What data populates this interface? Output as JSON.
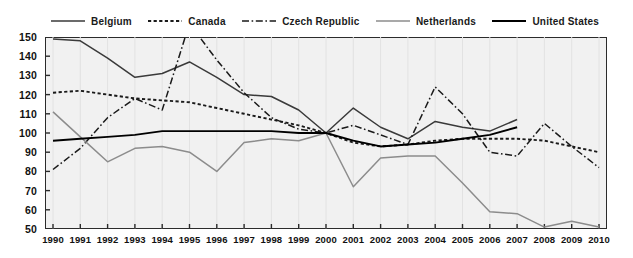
{
  "legend": {
    "position": "top",
    "items": [
      {
        "label": "Belgium",
        "style": "solid",
        "color": "#3a3a3a",
        "width": 1.6
      },
      {
        "label": "Canada",
        "style": "dotted",
        "color": "#1a1a1a",
        "width": 2.0
      },
      {
        "label": "Czech Republic",
        "style": "dashdot",
        "color": "#1a1a1a",
        "width": 1.6
      },
      {
        "label": "Netherlands",
        "style": "solid",
        "color": "#8c8c8c",
        "width": 1.6
      },
      {
        "label": "United States",
        "style": "solid",
        "color": "#000000",
        "width": 2.0
      }
    ]
  },
  "axes": {
    "y_ticks": [
      150,
      140,
      130,
      120,
      110,
      100,
      90,
      80,
      70,
      60,
      50
    ],
    "x_ticks": [
      1990,
      1991,
      1992,
      1993,
      1994,
      1995,
      1996,
      1997,
      1998,
      1999,
      2000,
      2001,
      2002,
      2003,
      2004,
      2005,
      2006,
      2007,
      2008,
      2009,
      2010
    ]
  },
  "chart_data": {
    "type": "line",
    "title": "",
    "subtitle": "",
    "xlabel": "",
    "ylabel": "",
    "xlim": [
      1990,
      2010
    ],
    "ylim": [
      50,
      150
    ],
    "grid": "vertical-faint",
    "legend_position": "top",
    "x": [
      1990,
      1991,
      1992,
      1993,
      1994,
      1995,
      1996,
      1997,
      1998,
      1999,
      2000,
      2001,
      2002,
      2003,
      2004,
      2005,
      2006,
      2007,
      2008,
      2009,
      2010
    ],
    "series": [
      {
        "name": "Belgium",
        "style": "solid",
        "color": "#3a3a3a",
        "values": [
          149,
          148,
          139,
          129,
          131,
          137,
          129,
          120,
          119,
          112,
          100,
          113,
          103,
          97,
          106,
          103,
          101,
          107,
          null,
          null,
          null
        ]
      },
      {
        "name": "Canada",
        "style": "dotted",
        "color": "#1a1a1a",
        "values": [
          121,
          122,
          120,
          118,
          117,
          116,
          113,
          110,
          107,
          104,
          100,
          95,
          93,
          94,
          96,
          97,
          97,
          97,
          96,
          93,
          90
        ]
      },
      {
        "name": "Czech Republic",
        "style": "dashdot",
        "color": "#1a1a1a",
        "values": [
          81,
          92,
          108,
          118,
          112,
          157,
          138,
          121,
          108,
          102,
          100,
          104,
          99,
          94,
          124,
          110,
          90,
          88,
          105,
          93,
          82
        ]
      },
      {
        "name": "Netherlands",
        "style": "solid",
        "color": "#8c8c8c",
        "values": [
          111,
          98,
          85,
          92,
          93,
          90,
          80,
          95,
          97,
          96,
          100,
          72,
          87,
          88,
          88,
          74,
          59,
          58,
          51,
          54,
          51
        ]
      },
      {
        "name": "United States",
        "style": "solid",
        "color": "#000000",
        "values": [
          96,
          97,
          98,
          99,
          101,
          101,
          101,
          101,
          101,
          100,
          100,
          96,
          93,
          94,
          95,
          97,
          99,
          103,
          null,
          null,
          null
        ]
      }
    ]
  }
}
